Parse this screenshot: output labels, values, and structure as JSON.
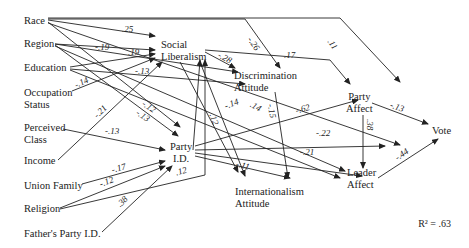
{
  "nodes": {
    "race": "Race",
    "region": "Region",
    "education": "Education",
    "occupation_1": "Occupation",
    "occupation_2": "Status",
    "perceived_1": "Perceived",
    "perceived_2": "Class",
    "income": "Income",
    "union": "Union Family",
    "religion": "Religion",
    "father": "Father's Party I.D.",
    "social_1": "Social",
    "social_2": "Liberalism",
    "discrim_1": "Discrimination",
    "discrim_2": "Attitude",
    "party_id_1": "Party",
    "party_id_2": "I.D.",
    "intl_1": "Internationalism",
    "intl_2": "Attitude",
    "party_affect_1": "Party",
    "party_affect_2": "Affect",
    "leader_1": "Leader",
    "leader_2": "Affect",
    "vote": "Vote"
  },
  "coefficients": [
    {
      "from": "Race",
      "to": "Social Liberalism",
      "value": ".25"
    },
    {
      "from": "Race",
      "to": "Discrimination Attitude",
      "value": "-.26"
    },
    {
      "from": "Race",
      "to": "Party Affect",
      "value": ".11"
    },
    {
      "from": "Region",
      "to": "Social Liberalism",
      "value": "-.19"
    },
    {
      "from": "Region",
      "to": "Discrimination Attitude",
      "value": ".19"
    },
    {
      "from": "Education",
      "to": "Discrimination Attitude",
      "value": "-.13"
    },
    {
      "from": "Occupation Status",
      "to": "Social Liberalism",
      "value": "-.14"
    },
    {
      "from": "Race",
      "to": "Party I.D.",
      "value": "-.12"
    },
    {
      "from": "Region",
      "to": "Party I.D.",
      "value": "-.13"
    },
    {
      "from": "Income",
      "to": "Social Liberalism",
      "value": "-.21"
    },
    {
      "from": "Perceived Class",
      "to": "Party I.D.",
      "value": "-.13"
    },
    {
      "from": "Union Family",
      "to": "Party I.D.",
      "value": "-.17"
    },
    {
      "from": "Religion",
      "to": "Party I.D.",
      "value": "-.12"
    },
    {
      "from": "Religion",
      "to": "Social Liberalism",
      "value": ".12"
    },
    {
      "from": "Father's Party I.D.",
      "to": "Party I.D.",
      "value": ".38"
    },
    {
      "from": "Social Liberalism",
      "to": "Discrimination Attitude",
      "value": "-.28"
    },
    {
      "from": "Social Liberalism",
      "to": "Party Affect",
      "value": ".17"
    },
    {
      "from": "Social Liberalism",
      "to": "Internationalism Attitude",
      "value": ".12"
    },
    {
      "from": "Region",
      "to": "Leader Affect",
      "value": "-.14"
    },
    {
      "from": "Education",
      "to": "Leader Affect",
      "value": ".14"
    },
    {
      "from": "Discrimination Attitude",
      "to": "Internationalism Attitude",
      "value": "-.15"
    },
    {
      "from": "Party I.D.",
      "to": "Party Affect",
      "value": "-.62"
    },
    {
      "from": "Party I.D.",
      "to": "Vote",
      "value": "-.22"
    },
    {
      "from": "Party I.D.",
      "to": "Leader Affect",
      "value": "-.21"
    },
    {
      "from": "Party I.D.",
      "to": "Internationalism Attitude",
      "value": "-.11"
    },
    {
      "from": "Party Affect",
      "to": "Vote",
      "value": "-.13"
    },
    {
      "from": "Party Affect",
      "to": "Leader Affect",
      "value": ".38"
    },
    {
      "from": "Leader Affect",
      "to": "Vote",
      "value": "-.44"
    }
  ],
  "r_squared_label": "R² = .63"
}
